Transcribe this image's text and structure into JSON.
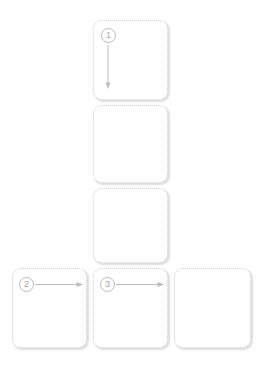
{
  "canvas": {
    "width": 267,
    "height": 369,
    "background": "#ffffff",
    "title": "Storyboard wireframe grid"
  },
  "style": {
    "panel_border_color": "#cfcfcf",
    "panel_fill": "#ffffff",
    "panel_shadow": "rgba(150,150,150,0.30)",
    "marker_color": "#a8a8a8",
    "marker_border_color": "#b9b9b9",
    "arrow_color": "#bdbdbd",
    "panel_radius_px": 9
  },
  "panels": [
    {
      "id": "panel-top",
      "name": "panel-column-middle-1",
      "label": "",
      "x": 93,
      "y": 20,
      "width": 75,
      "height": 80,
      "marker": "1",
      "arrow": "down"
    },
    {
      "id": "panel-middle",
      "name": "panel-column-middle-2",
      "label": "",
      "x": 93,
      "y": 105,
      "width": 75,
      "height": 78,
      "marker": "",
      "arrow": "none"
    },
    {
      "id": "panel-third",
      "name": "panel-column-middle-3",
      "label": "",
      "x": 93,
      "y": 188,
      "width": 75,
      "height": 75,
      "marker": "",
      "arrow": "none"
    },
    {
      "id": "panel-bottom-1",
      "name": "panel-row-bottom-1",
      "label": "",
      "x": 12,
      "y": 268,
      "width": 75,
      "height": 80,
      "marker": "2",
      "arrow": "right"
    },
    {
      "id": "panel-bottom-2",
      "name": "panel-row-bottom-2",
      "label": "",
      "x": 93,
      "y": 268,
      "width": 75,
      "height": 80,
      "marker": "3",
      "arrow": "right"
    },
    {
      "id": "panel-bottom-3",
      "name": "panel-row-bottom-3",
      "label": "",
      "x": 174,
      "y": 268,
      "width": 77,
      "height": 80,
      "marker": "",
      "arrow": "none"
    }
  ],
  "markers": {
    "one": "1",
    "two": "2",
    "three": "3"
  },
  "arrows": [
    {
      "name": "arrow-down-from-marker-1",
      "direction": "down",
      "from_marker": "1",
      "x1": 108,
      "y1": 45,
      "x2": 108,
      "y2": 88
    },
    {
      "name": "arrow-right-from-marker-2",
      "direction": "right",
      "from_marker": "2",
      "x1": 34,
      "y1": 284,
      "x2": 82,
      "y2": 284
    },
    {
      "name": "arrow-right-from-marker-3",
      "direction": "right",
      "from_marker": "3",
      "x1": 115,
      "y1": 284,
      "x2": 163,
      "y2": 284
    }
  ]
}
